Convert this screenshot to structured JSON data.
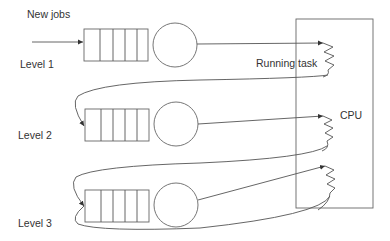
{
  "diagram": {
    "labels": {
      "new_jobs": "New jobs",
      "running_task": "Running task",
      "cpu": "CPU"
    },
    "levels": [
      {
        "label": "Level 1",
        "queue_slots": 5
      },
      {
        "label": "Level 2",
        "queue_slots": 5
      },
      {
        "label": "Level 3",
        "queue_slots": 5
      }
    ],
    "colors": {
      "line": "#555555",
      "text": "#333333",
      "background": "#ffffff"
    }
  }
}
